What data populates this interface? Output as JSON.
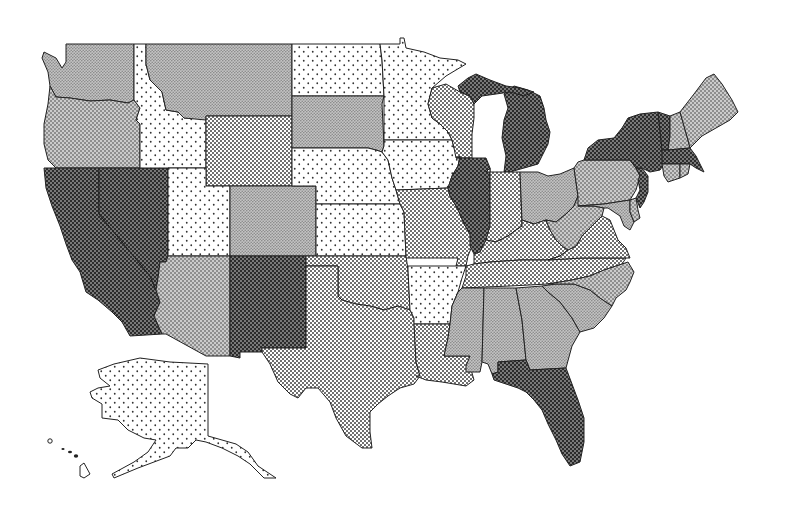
{
  "map": {
    "type": "choropleth",
    "region": "United States",
    "levels": [
      {
        "id": "l1",
        "name": "level-1-sparse-dots",
        "base": "#ffffff",
        "dot": "#333333",
        "spacing": 9,
        "r": 0.9
      },
      {
        "id": "l2",
        "name": "level-2-dense-dots",
        "base": "#ffffff",
        "dot": "#333333",
        "spacing": 4,
        "r": 0.95
      },
      {
        "id": "l3",
        "name": "level-3-light-gray",
        "base": "#c4c4c4",
        "dot": "#8a8a8a",
        "spacing": 3,
        "r": 0.8
      },
      {
        "id": "l4",
        "name": "level-4-medium-crosshatch",
        "base": "#8e8e8e",
        "dot": "#e0e0e0",
        "spacing": 4,
        "r": 1.0
      },
      {
        "id": "l5",
        "name": "level-5-dark-crosshatch",
        "base": "#2c2c2c",
        "dot": "#9a9a9a",
        "spacing": 4,
        "r": 0.95
      }
    ],
    "states": [
      {
        "abbr": "WA",
        "level": "l3"
      },
      {
        "abbr": "OR",
        "level": "l4"
      },
      {
        "abbr": "CA",
        "level": "l5"
      },
      {
        "abbr": "NV",
        "level": "l5"
      },
      {
        "abbr": "ID",
        "level": "l1"
      },
      {
        "abbr": "MT",
        "level": "l3"
      },
      {
        "abbr": "WY",
        "level": "l2"
      },
      {
        "abbr": "UT",
        "level": "l1"
      },
      {
        "abbr": "CO",
        "level": "l3"
      },
      {
        "abbr": "AZ",
        "level": "l4"
      },
      {
        "abbr": "NM",
        "level": "l5"
      },
      {
        "abbr": "ND",
        "level": "l1"
      },
      {
        "abbr": "SD",
        "level": "l3"
      },
      {
        "abbr": "NE",
        "level": "l1"
      },
      {
        "abbr": "KS",
        "level": "l1"
      },
      {
        "abbr": "OK",
        "level": "l2"
      },
      {
        "abbr": "TX",
        "level": "l2"
      },
      {
        "abbr": "MN",
        "level": "l1"
      },
      {
        "abbr": "IA",
        "level": "l1"
      },
      {
        "abbr": "MO",
        "level": "l2"
      },
      {
        "abbr": "AR",
        "level": "l1"
      },
      {
        "abbr": "LA",
        "level": "l2"
      },
      {
        "abbr": "WI",
        "level": "l2"
      },
      {
        "abbr": "IL",
        "level": "l5"
      },
      {
        "abbr": "MI",
        "level": "l5"
      },
      {
        "abbr": "IN",
        "level": "l2"
      },
      {
        "abbr": "OH",
        "level": "l3"
      },
      {
        "abbr": "KY",
        "level": "l2"
      },
      {
        "abbr": "TN",
        "level": "l2"
      },
      {
        "abbr": "MS",
        "level": "l3"
      },
      {
        "abbr": "AL",
        "level": "l3"
      },
      {
        "abbr": "GA",
        "level": "l3"
      },
      {
        "abbr": "FL",
        "level": "l5"
      },
      {
        "abbr": "SC",
        "level": "l3"
      },
      {
        "abbr": "NC",
        "level": "l4"
      },
      {
        "abbr": "VA",
        "level": "l2"
      },
      {
        "abbr": "WV",
        "level": "l4"
      },
      {
        "abbr": "PA",
        "level": "l4"
      },
      {
        "abbr": "MD",
        "level": "l3"
      },
      {
        "abbr": "DE",
        "level": "l4"
      },
      {
        "abbr": "NJ",
        "level": "l5"
      },
      {
        "abbr": "NY",
        "level": "l5"
      },
      {
        "abbr": "CT",
        "level": "l4"
      },
      {
        "abbr": "RI",
        "level": "l4"
      },
      {
        "abbr": "MA",
        "level": "l5"
      },
      {
        "abbr": "VT",
        "level": "l5"
      },
      {
        "abbr": "NH",
        "level": "l4"
      },
      {
        "abbr": "ME",
        "level": "l4"
      },
      {
        "abbr": "AK",
        "level": "l1"
      },
      {
        "abbr": "HI",
        "level": "none"
      }
    ]
  }
}
